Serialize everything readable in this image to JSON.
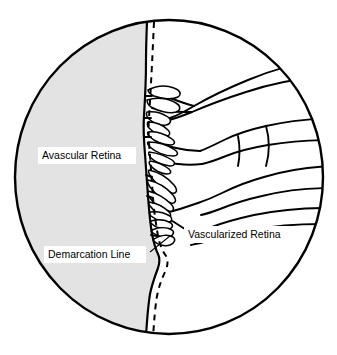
{
  "figure": {
    "name": "retinopathy-of-prematurity-stage-2-diagram",
    "canvas": {
      "width": 337,
      "height": 355
    }
  },
  "colors": {
    "outline": "#000000",
    "avascular_fill": "#e3e3e3",
    "vascular_fill": "#ffffff",
    "label_background": "#ffffff",
    "page_background": "#ffffff"
  },
  "labels": [
    {
      "id": "avascular-retina",
      "text": "Avascular Retina",
      "x": 40,
      "y": 156,
      "has_leader": false
    },
    {
      "id": "vascularized-retina",
      "text": "Vascularized Retina",
      "x": 186,
      "y": 235,
      "has_leader": false
    },
    {
      "id": "demarcation-line",
      "text": "Demarcation Line",
      "x": 48,
      "y": 255,
      "has_leader": true,
      "leader_from": {
        "x": 152,
        "y": 251
      },
      "leader_to": {
        "x": 168,
        "y": 236
      }
    }
  ],
  "regions": [
    {
      "id": "avascular-region",
      "label": "Avascular Retina",
      "fill": "#e3e3e3",
      "side": "left"
    },
    {
      "id": "vascularized-region",
      "label": "Vascularized Retina",
      "fill": "#ffffff",
      "side": "right"
    }
  ],
  "features": {
    "demarcation_ridge": {
      "id": "demarcation-ridge",
      "style": "solid",
      "description": "Solid boundary between avascular and vascularized retina"
    },
    "dashed_boundary": {
      "id": "dashed-demarcation-line",
      "style": "dashed",
      "description": "Dashed line marking the demarcation line running parallel to the ridge"
    },
    "circle_boundary": {
      "id": "fundus-circle",
      "center_x": 169,
      "center_y": 177,
      "radius_x": 155,
      "radius_y": 158
    },
    "vessel_count_major": 6,
    "capillary_tuft_count": 18
  }
}
